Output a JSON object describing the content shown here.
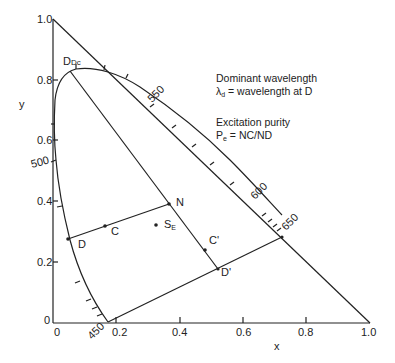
{
  "diagram": {
    "axes": {
      "x_label": "x",
      "y_label": "y",
      "x_ticks": [
        "0",
        "0.2",
        "0.4",
        "0.6",
        "0.8",
        "1.0"
      ],
      "y_ticks": [
        "0",
        "0.2",
        "0.4",
        "0.6",
        "0.8",
        "1.0"
      ]
    },
    "wavelength_labels": {
      "w450": "450",
      "w500": "500",
      "w550": "550",
      "w600": "600",
      "w650": "650"
    },
    "points": {
      "Dc": "Dc",
      "D": "D",
      "C": "C",
      "N": "N",
      "SE_main": "S",
      "SE_sub": "E",
      "C_prime": "C'",
      "D_prime": "D'"
    },
    "annotations": {
      "dominant_title": "Dominant wavelength",
      "dominant_lambda": "λ",
      "dominant_sub": "d",
      "dominant_eq": " = wavelength at D",
      "purity_title": "Excitation purity",
      "purity_P": "P",
      "purity_sub": "e",
      "purity_eq": " = NC/ND"
    },
    "coordinates": {
      "Dc": [
        0.054,
        0.829
      ],
      "D": [
        0.047,
        0.276
      ],
      "C": [
        0.164,
        0.319
      ],
      "N": [
        0.366,
        0.391
      ],
      "SE": [
        0.325,
        0.322
      ],
      "C_prime": [
        0.48,
        0.24
      ],
      "D_prime": [
        0.521,
        0.178
      ],
      "locus_650": [
        0.723,
        0.283
      ],
      "locus_450_end": [
        0.174,
        0.003
      ]
    }
  }
}
